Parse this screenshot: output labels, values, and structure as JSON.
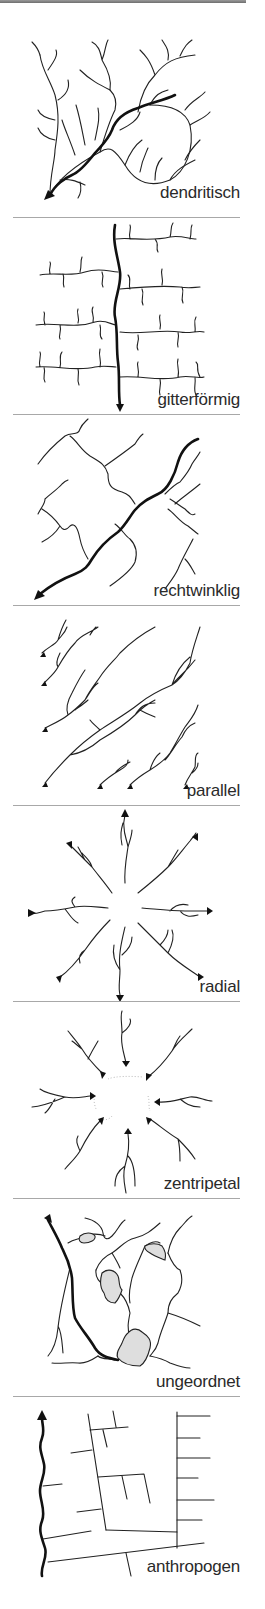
{
  "panels": [
    {
      "id": "dendritisch",
      "label": "dendritisch",
      "top": 10,
      "height": 207,
      "label_top": 183
    },
    {
      "id": "gitterfoermig",
      "label": "gitterförmig",
      "top": 218,
      "height": 196,
      "label_top": 390
    },
    {
      "id": "rechtwinklig",
      "label": "rechtwinklig",
      "top": 415,
      "height": 190,
      "label_top": 581
    },
    {
      "id": "parallel",
      "label": "parallel",
      "top": 606,
      "height": 199,
      "label_top": 781
    },
    {
      "id": "radial",
      "label": "radial",
      "top": 806,
      "height": 195,
      "label_top": 977
    },
    {
      "id": "zentripetal",
      "label": "zentripetal",
      "top": 1002,
      "height": 196,
      "label_top": 1174
    },
    {
      "id": "ungeordnet",
      "label": "ungeordnet",
      "top": 1199,
      "height": 197,
      "label_top": 1372
    },
    {
      "id": "anthropogen",
      "label": "anthropogen",
      "top": 1397,
      "height": 212,
      "label_top": 1557
    }
  ],
  "separators_y": [
    217,
    414,
    605,
    805,
    1001,
    1198,
    1396
  ],
  "colors": {
    "line": "#222222",
    "main_river": "#111111",
    "separator": "#a8a8a8",
    "lake_fill": "#dedede",
    "label": "#2a2a2a"
  }
}
